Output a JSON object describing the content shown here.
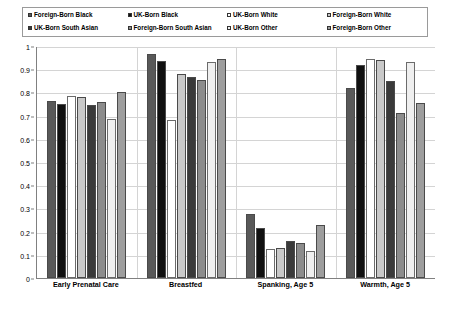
{
  "chart_data": {
    "type": "bar",
    "title": "",
    "xlabel": "",
    "ylabel": "",
    "ylim": [
      0,
      1
    ],
    "ytick_labels": [
      "1",
      "0.9",
      "0.8",
      "0.7",
      "0.6",
      "0.5",
      "0.4",
      "0.3",
      "0.2",
      "0.1",
      "0"
    ],
    "ytick_values": [
      1,
      0.9,
      0.8,
      0.7,
      0.6,
      0.5,
      0.4,
      0.3,
      0.2,
      0.1,
      0
    ],
    "grid": true,
    "legend_position": "top",
    "categories": [
      "Early Prenatal Care",
      "Breastfed",
      "Spanking, Age 5",
      "Warmth, Age 5"
    ],
    "series": [
      {
        "name": "Foreign-Born Black",
        "color": "#595959",
        "values": [
          0.765,
          0.965,
          0.275,
          0.82
        ]
      },
      {
        "name": "UK-Born Black",
        "color": "#111111",
        "values": [
          0.752,
          0.935,
          0.215,
          0.92
        ]
      },
      {
        "name": "UK-Born White",
        "color": "#ffffff",
        "values": [
          0.785,
          0.68,
          0.125,
          0.945
        ]
      },
      {
        "name": "Foreign-Born White",
        "color": "#c9c9c9",
        "values": [
          0.78,
          0.88,
          0.13,
          0.94
        ]
      },
      {
        "name": "UK-Born South Asian",
        "color": "#3a3a3a",
        "values": [
          0.745,
          0.865,
          0.16,
          0.85
        ]
      },
      {
        "name": "Foreign-Born South Asian",
        "color": "#8c8c8c",
        "values": [
          0.76,
          0.855,
          0.152,
          0.71
        ]
      },
      {
        "name": "UK-Born Other",
        "color": "#efefef",
        "values": [
          0.685,
          0.93,
          0.118,
          0.93
        ]
      },
      {
        "name": "Foreign-Born Other",
        "color": "#9e9e9e",
        "values": [
          0.8,
          0.942,
          0.228,
          0.755
        ]
      }
    ]
  }
}
